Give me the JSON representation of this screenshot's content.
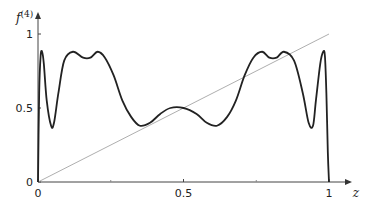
{
  "chart_data": {
    "type": "line",
    "title": "",
    "xlabel": "z",
    "ylabel": "f(4)",
    "ylabel_base": "f",
    "ylabel_sup": "(4)",
    "xlim": [
      0,
      1
    ],
    "ylim": [
      0,
      1.05
    ],
    "grid": false,
    "x_ticks": [
      0,
      0.5,
      1
    ],
    "x_tick_labels": [
      "0",
      "0.5",
      "1"
    ],
    "y_ticks": [
      0,
      0.5,
      1
    ],
    "y_tick_labels": [
      "0",
      "0.5",
      "1"
    ],
    "series": [
      {
        "name": "f(4)",
        "style": "thick dark curve",
        "color": "#222222",
        "x": [
          0.0,
          0.004,
          0.009,
          0.014,
          0.02,
          0.03,
          0.045,
          0.055,
          0.07,
          0.09,
          0.12,
          0.155,
          0.18,
          0.205,
          0.23,
          0.26,
          0.29,
          0.32,
          0.35,
          0.385,
          0.42,
          0.455,
          0.5,
          0.545,
          0.58,
          0.615,
          0.65,
          0.68,
          0.71,
          0.74,
          0.77,
          0.795,
          0.82,
          0.845,
          0.88,
          0.91,
          0.93,
          0.945,
          0.955,
          0.97,
          0.98,
          0.986,
          0.991,
          0.996,
          1.0
        ],
        "values": [
          0.0,
          0.6,
          0.85,
          0.88,
          0.8,
          0.55,
          0.38,
          0.4,
          0.6,
          0.82,
          0.88,
          0.84,
          0.84,
          0.88,
          0.84,
          0.72,
          0.55,
          0.44,
          0.38,
          0.4,
          0.46,
          0.5,
          0.5,
          0.46,
          0.4,
          0.38,
          0.44,
          0.55,
          0.72,
          0.84,
          0.88,
          0.84,
          0.84,
          0.88,
          0.82,
          0.6,
          0.4,
          0.38,
          0.55,
          0.8,
          0.88,
          0.85,
          0.6,
          0.2,
          0.0
        ]
      },
      {
        "name": "z",
        "style": "thin gray line",
        "color": "#999999",
        "x": [
          0,
          1
        ],
        "values": [
          0,
          1
        ]
      }
    ]
  }
}
